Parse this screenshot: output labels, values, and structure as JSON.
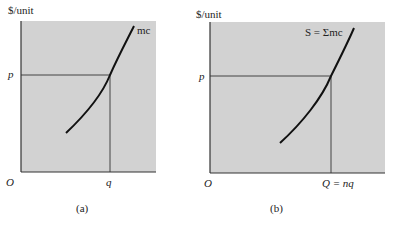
{
  "colors": {
    "panel_bg": "#d2d2d2",
    "axis": "#333333",
    "curve": "#111111"
  },
  "panels": [
    {
      "id": "a",
      "caption": "(a)",
      "y_axis_label": "$/unit",
      "origin_label": "O",
      "price_label": "p",
      "quantity_label": "q",
      "curve_label": "mc"
    },
    {
      "id": "b",
      "caption": "(b)",
      "y_axis_label": "$/unit",
      "origin_label": "O",
      "price_label": "p",
      "quantity_label": "Q = nq",
      "curve_label": "S = Σmc"
    }
  ]
}
